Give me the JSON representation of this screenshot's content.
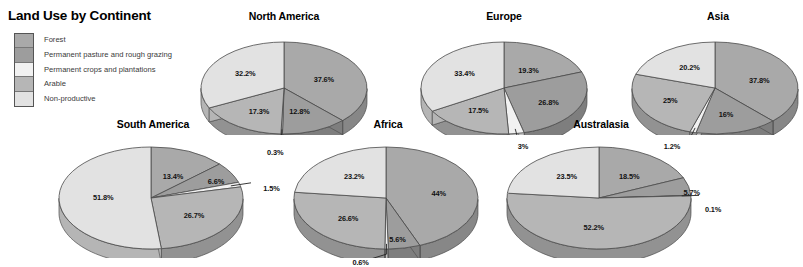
{
  "legend": {
    "title": "Land Use by Continent",
    "items": [
      {
        "label": "Forest",
        "color": "#a9a9a9"
      },
      {
        "label": "Permanent pasture and rough grazing",
        "color": "#9d9d9d"
      },
      {
        "label": "Permanent crops and plantations",
        "color": "#f1f1f1"
      },
      {
        "label": "Arable",
        "color": "#b6b6b6"
      },
      {
        "label": "Non-productive",
        "color": "#e2e2e2"
      }
    ]
  },
  "chart_data": {
    "type": "pie",
    "title": "Land Use by Continent",
    "units": "percent",
    "categories": [
      "Forest",
      "Permanent pasture and rough grazing",
      "Permanent crops and plantations",
      "Arable",
      "Non-productive"
    ],
    "slice_colors": [
      "#a9a9a9",
      "#9d9d9d",
      "#f1f1f1",
      "#b6b6b6",
      "#e2e2e2"
    ],
    "legend_position": "top-left",
    "grid": false,
    "charts": [
      {
        "name": "north-america",
        "title": "North America",
        "labels": [
          "37.6%",
          "12.8%",
          "0.3%",
          "17.3%",
          "32.2%"
        ],
        "values": [
          37.6,
          12.8,
          0.3,
          17.3,
          32.2
        ]
      },
      {
        "name": "europe",
        "title": "Europe",
        "labels": [
          "19.3%",
          "26.8%",
          "3%",
          "17.5%",
          "33.4%"
        ],
        "values": [
          19.3,
          26.8,
          3.0,
          17.5,
          33.4
        ]
      },
      {
        "name": "asia",
        "title": "Asia",
        "labels": [
          "37.8%",
          "16%",
          "1.2%",
          "25%",
          "20.2%"
        ],
        "values": [
          37.8,
          16.0,
          1.2,
          25.0,
          20.2
        ]
      },
      {
        "name": "south-america",
        "title": "South America",
        "labels": [
          "13.4%",
          "6.6%",
          "1.5%",
          "26.7%",
          "51.8%"
        ],
        "values": [
          13.4,
          6.6,
          1.5,
          26.7,
          51.8
        ]
      },
      {
        "name": "africa",
        "title": "Africa",
        "labels": [
          "44%",
          "5.6%",
          "0.6%",
          "26.6%",
          "23.2%"
        ],
        "values": [
          44.0,
          5.6,
          0.6,
          26.6,
          23.2
        ]
      },
      {
        "name": "australasia",
        "title": "Australasia",
        "labels": [
          "18.5%",
          "5.7%",
          "0.1%",
          "52.2%",
          "23.5%"
        ],
        "values": [
          18.5,
          5.7,
          0.1,
          52.2,
          23.5
        ]
      }
    ]
  },
  "layout": {
    "pies": [
      {
        "name": "north-america",
        "x": 196,
        "y": 10,
        "w": 176,
        "h": 125,
        "cx": 88,
        "cy": 78,
        "rx": 83,
        "ry": 46,
        "depth": 14,
        "start": -90
      },
      {
        "name": "europe",
        "x": 416,
        "y": 10,
        "w": 176,
        "h": 125,
        "cx": 88,
        "cy": 78,
        "rx": 83,
        "ry": 46,
        "depth": 14,
        "start": -90
      },
      {
        "name": "asia",
        "x": 630,
        "y": 10,
        "w": 176,
        "h": 125,
        "cx": 85,
        "cy": 78,
        "rx": 83,
        "ry": 46,
        "depth": 14,
        "start": -90
      },
      {
        "name": "south-america",
        "x": 55,
        "y": 118,
        "w": 196,
        "h": 140,
        "cx": 96,
        "cy": 80,
        "rx": 92,
        "ry": 51,
        "depth": 15,
        "start": -90
      },
      {
        "name": "africa",
        "x": 290,
        "y": 118,
        "w": 196,
        "h": 140,
        "cx": 96,
        "cy": 80,
        "rx": 92,
        "ry": 51,
        "depth": 15,
        "start": -90
      },
      {
        "name": "australasia",
        "x": 503,
        "y": 118,
        "w": 196,
        "h": 140,
        "cx": 96,
        "cy": 80,
        "rx": 92,
        "ry": 51,
        "depth": 15,
        "start": -90
      }
    ],
    "label_overrides": {
      "north-america": [
        {
          "r": 0.52,
          "dx": 0,
          "dy": 0
        },
        {
          "r": 0.5,
          "dx": 0,
          "dy": 2
        },
        {
          "r": 1.18,
          "dx": -6,
          "dy": 10,
          "leader": true
        },
        {
          "r": 0.55,
          "dx": 0,
          "dy": 2
        },
        {
          "r": 0.55,
          "dx": 0,
          "dy": -2
        }
      ],
      "europe": [
        {
          "r": 0.52,
          "dx": 0,
          "dy": 2
        },
        {
          "r": 0.55,
          "dx": 4,
          "dy": 2
        },
        {
          "r": 1.05,
          "dx": 6,
          "dy": 10,
          "leader": true
        },
        {
          "r": 0.55,
          "dx": -4,
          "dy": 0
        },
        {
          "r": 0.55,
          "dx": 0,
          "dy": -2
        }
      ],
      "asia": [
        {
          "r": 0.55,
          "dx": 2,
          "dy": 2
        },
        {
          "r": 0.5,
          "dx": 0,
          "dy": 4
        },
        {
          "r": 1.22,
          "dx": -16,
          "dy": 4,
          "leader": true
        },
        {
          "r": 0.58,
          "dx": -2,
          "dy": 0
        },
        {
          "r": 0.52,
          "dx": 0,
          "dy": -2
        }
      ],
      "south-america": [
        {
          "r": 0.48,
          "dx": 4,
          "dy": 0
        },
        {
          "r": 0.74,
          "dx": 6,
          "dy": 2
        },
        {
          "r": 1.2,
          "dx": 14,
          "dy": 6,
          "leader": true
        },
        {
          "r": 0.52,
          "dx": 4,
          "dy": 2
        },
        {
          "r": 0.52,
          "dx": 0,
          "dy": -2
        }
      ],
      "africa": [
        {
          "r": 0.54,
          "dx": 4,
          "dy": 0
        },
        {
          "r": 0.62,
          "dx": 0,
          "dy": 10
        },
        {
          "r": 1.1,
          "dx": -26,
          "dy": 8,
          "leader": true
        },
        {
          "r": 0.52,
          "dx": -2,
          "dy": 2
        },
        {
          "r": 0.52,
          "dx": 0,
          "dy": -2
        }
      ],
      "australasia": [
        {
          "r": 0.52,
          "dx": 4,
          "dy": 0
        },
        {
          "r": 0.88,
          "dx": 14,
          "dy": 4
        },
        {
          "r": 1.22,
          "dx": 2,
          "dy": 14,
          "leader": true
        },
        {
          "r": 0.5,
          "dx": -4,
          "dy": 4
        },
        {
          "r": 0.52,
          "dx": 0,
          "dy": -2
        }
      ]
    }
  }
}
